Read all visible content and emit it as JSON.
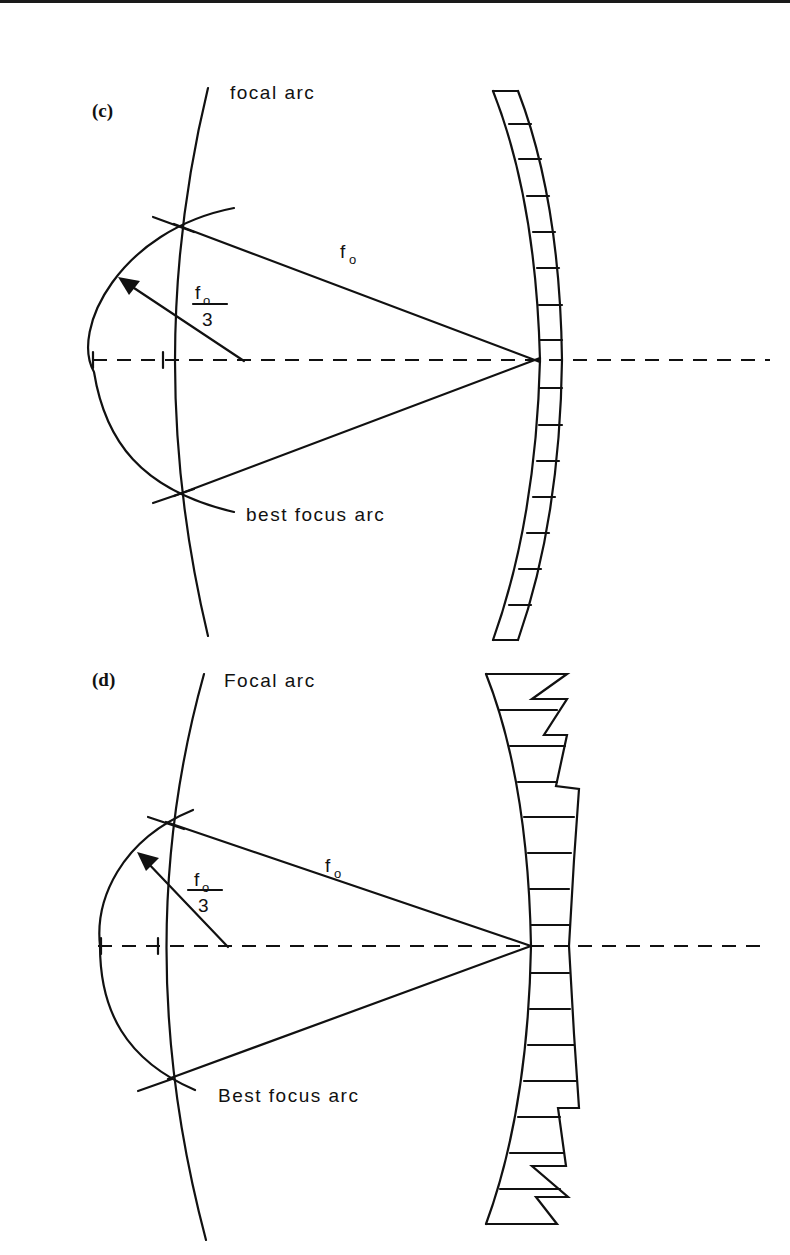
{
  "figure": {
    "panels": [
      {
        "id": "c",
        "label": "(c)",
        "focal_arc_label": "focal arc",
        "best_focus_arc_label": "best focus arc",
        "focal_length_label": "f",
        "focal_length_sub": "o",
        "radius_numerator": "f",
        "radius_numerator_sub": "o",
        "radius_denominator": "3",
        "mirror_type": "segmented, uniform segments"
      },
      {
        "id": "d",
        "label": "(d)",
        "focal_arc_label": "Focal arc",
        "best_focus_arc_label": "Best focus arc",
        "focal_length_label": "f",
        "focal_length_sub": "o",
        "radius_numerator": "f",
        "radius_numerator_sub": "o",
        "radius_denominator": "3",
        "mirror_type": "segmented, stepped outer edge"
      }
    ]
  },
  "colors": {
    "ink": "#111111",
    "background": "#ffffff"
  }
}
